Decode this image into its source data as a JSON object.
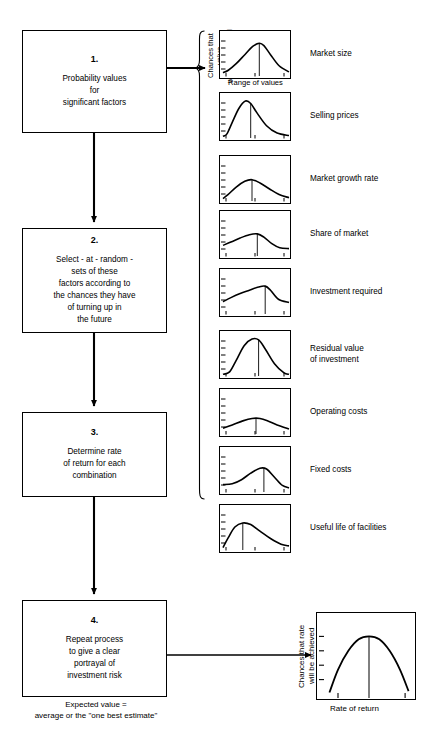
{
  "diagram": {
    "boxes": [
      {
        "number": "1.",
        "text": "Probability values\nfor\nsignificant factors"
      },
      {
        "number": "2.",
        "text": "Select - at - random -\nsets of these\nfactors according to\nthe chances they have\nof turning up in\nthe future"
      },
      {
        "number": "3.",
        "text": "Determine rate\nof return for each\ncombination"
      },
      {
        "number": "4.",
        "text": "Repeat process\nto give a clear\nportrayal of\ninvestment risk"
      }
    ],
    "note": "Expected value =\naverage or the \"one best estimate\""
  },
  "input_axis": {
    "y_label": "Chances that value\nwill be achieved",
    "x_label": "Range of values"
  },
  "output_axis": {
    "y_label": "Chances that rate\nwill be achieved",
    "x_label": "Rate of return"
  },
  "chart_data": [
    {
      "type": "line",
      "title": "Market size",
      "xlabel": "Range of values",
      "ylabel": "Chances that value will be achieved",
      "x": [
        0,
        0.08,
        0.2,
        0.33,
        0.45,
        0.55,
        0.62,
        0.72,
        0.85,
        1.0
      ],
      "values": [
        0.08,
        0.14,
        0.3,
        0.52,
        0.72,
        0.8,
        0.74,
        0.52,
        0.25,
        0.1
      ],
      "mean_marker": 0.55,
      "ylim": [
        0,
        1
      ],
      "grid": false
    },
    {
      "type": "line",
      "title": "Selling prices",
      "xlabel": "Range of values",
      "ylabel": "Chances that value will be achieved",
      "x": [
        0,
        0.06,
        0.14,
        0.24,
        0.34,
        0.42,
        0.52,
        0.66,
        0.82,
        1.0
      ],
      "values": [
        0.04,
        0.1,
        0.38,
        0.72,
        0.9,
        0.84,
        0.6,
        0.3,
        0.12,
        0.06
      ],
      "mean_marker": 0.42,
      "ylim": [
        0,
        1
      ],
      "grid": false
    },
    {
      "type": "line",
      "title": "Market growth rate",
      "xlabel": "Range of values",
      "ylabel": "Chances that value will be achieved",
      "x": [
        0,
        0.08,
        0.2,
        0.33,
        0.44,
        0.56,
        0.7,
        0.85,
        1.0
      ],
      "values": [
        0.06,
        0.16,
        0.34,
        0.48,
        0.52,
        0.44,
        0.3,
        0.16,
        0.08
      ],
      "mean_marker": 0.44,
      "ylim": [
        0,
        1
      ],
      "grid": false
    },
    {
      "type": "line",
      "title": "Share of market",
      "xlabel": "Range of values",
      "ylabel": "Chances that value will be achieved",
      "x": [
        0,
        0.12,
        0.26,
        0.4,
        0.52,
        0.62,
        0.74,
        0.86,
        1.0
      ],
      "values": [
        0.26,
        0.34,
        0.44,
        0.52,
        0.54,
        0.46,
        0.3,
        0.2,
        0.18
      ],
      "mean_marker": 0.52,
      "ylim": [
        0,
        1
      ],
      "grid": false
    },
    {
      "type": "line",
      "title": "Investment required",
      "xlabel": "Range of values",
      "ylabel": "Chances that value will be achieved",
      "x": [
        0,
        0.12,
        0.26,
        0.4,
        0.54,
        0.64,
        0.72,
        0.84,
        1.0
      ],
      "values": [
        0.3,
        0.4,
        0.5,
        0.58,
        0.66,
        0.68,
        0.58,
        0.36,
        0.28
      ],
      "mean_marker": 0.64,
      "ylim": [
        0,
        1
      ],
      "grid": false
    },
    {
      "type": "line",
      "title": "Residual value of investment",
      "xlabel": "Range of values",
      "ylabel": "Chances that value will be achieved",
      "x": [
        0,
        0.1,
        0.2,
        0.32,
        0.44,
        0.54,
        0.64,
        0.78,
        0.92,
        1.0
      ],
      "values": [
        0.04,
        0.1,
        0.38,
        0.74,
        0.9,
        0.88,
        0.66,
        0.3,
        0.08,
        0.04
      ],
      "mean_marker": 0.54,
      "ylim": [
        0,
        1
      ],
      "grid": false
    },
    {
      "type": "line",
      "title": "Operating costs",
      "xlabel": "Range of values",
      "ylabel": "Chances that value will be achieved",
      "x": [
        0,
        0.14,
        0.3,
        0.44,
        0.56,
        0.68,
        0.82,
        1.0
      ],
      "values": [
        0.14,
        0.22,
        0.32,
        0.38,
        0.38,
        0.32,
        0.22,
        0.12
      ],
      "mean_marker": 0.5,
      "ylim": [
        0,
        1
      ],
      "grid": false
    },
    {
      "type": "line",
      "title": "Fixed costs",
      "xlabel": "Range of values",
      "ylabel": "Chances that value will be achieved",
      "x": [
        0,
        0.14,
        0.28,
        0.42,
        0.56,
        0.66,
        0.78,
        0.9,
        1.0
      ],
      "values": [
        0.18,
        0.2,
        0.3,
        0.46,
        0.58,
        0.56,
        0.36,
        0.16,
        0.1
      ],
      "mean_marker": 0.62,
      "ylim": [
        0,
        1
      ],
      "grid": false
    },
    {
      "type": "line",
      "title": "Useful life of facilities",
      "xlabel": "Range of values",
      "ylabel": "Chances that value will be achieved",
      "x": [
        0,
        0.08,
        0.18,
        0.3,
        0.42,
        0.56,
        0.72,
        0.88,
        1.0
      ],
      "values": [
        0.06,
        0.3,
        0.56,
        0.66,
        0.62,
        0.46,
        0.28,
        0.14,
        0.1
      ],
      "mean_marker": 0.3,
      "ylim": [
        0,
        1
      ],
      "grid": false
    },
    {
      "type": "line",
      "title": "Rate of return distribution",
      "xlabel": "Rate of return",
      "ylabel": "Chances that rate will be achieved",
      "x": [
        0.04,
        0.14,
        0.26,
        0.38,
        0.5,
        0.62,
        0.74,
        0.86,
        0.96
      ],
      "values": [
        0.02,
        0.34,
        0.6,
        0.76,
        0.8,
        0.76,
        0.6,
        0.34,
        0.04
      ],
      "mean_marker": 0.5,
      "ylim": [
        0,
        1
      ],
      "grid": false
    }
  ],
  "factor_labels": [
    "Market size",
    "Selling prices",
    "Market growth rate",
    "Share of market",
    "Investment required",
    "Residual value\nof investment",
    "Operating costs",
    "Fixed costs",
    "Useful life  of facilities"
  ]
}
